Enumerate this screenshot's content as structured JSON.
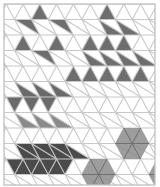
{
  "figure": {
    "width": 160,
    "height": 187,
    "grid": {
      "left": 4,
      "right": 155,
      "top": 4,
      "bottom": 185,
      "side": 16.8,
      "row_height": 15.5,
      "x0": 6.2,
      "line_color": "#c8c8c8",
      "border_color": "#c0c0c0",
      "rows": 12
    },
    "colors": {
      "medium": "#6e6e6e",
      "diamond": "#6a6a6a",
      "light": "#8a8a8a",
      "dark": "#4a4a4a",
      "hex": "#8c8c8c",
      "hex_lines": "#707070"
    },
    "shapes": [
      {
        "name": "single-triangle-top-left",
        "tone": "medium",
        "triangles": [
          {
            "row": 0,
            "k": 2,
            "dir": "up"
          }
        ]
      },
      {
        "name": "hourglass-left",
        "tone": "medium",
        "triangles": [
          {
            "row": 1,
            "k": 1,
            "dir": "down"
          },
          {
            "row": 1,
            "k": 3,
            "dir": "down"
          },
          {
            "row": 2,
            "k": 1,
            "dir": "up"
          },
          {
            "row": 2,
            "k": 3,
            "dir": "up"
          },
          {
            "row": 3,
            "k": 2,
            "dir": "down"
          }
        ]
      },
      {
        "name": "pyramid",
        "tone": "medium",
        "triangles": [
          {
            "row": 0,
            "k": 6,
            "dir": "up"
          },
          {
            "row": 1,
            "k": 6,
            "dir": "up"
          },
          {
            "row": 1,
            "k": 7,
            "dir": "up"
          },
          {
            "row": 2,
            "k": 5,
            "dir": "up"
          },
          {
            "row": 2,
            "k": 6,
            "dir": "up"
          },
          {
            "row": 2,
            "k": 7,
            "dir": "up"
          },
          {
            "row": 3,
            "k": 5,
            "dir": "up"
          },
          {
            "row": 3,
            "k": 6,
            "dir": "up"
          },
          {
            "row": 3,
            "k": 7,
            "dir": "up"
          },
          {
            "row": 3,
            "k": 8,
            "dir": "up"
          },
          {
            "row": 4,
            "k": 4,
            "dir": "up"
          },
          {
            "row": 4,
            "k": 5,
            "dir": "up"
          },
          {
            "row": 4,
            "k": 6,
            "dir": "up"
          },
          {
            "row": 4,
            "k": 7,
            "dir": "up"
          },
          {
            "row": 4,
            "k": 8,
            "dir": "up"
          }
        ]
      },
      {
        "name": "diamonds-left",
        "tone": "diamond",
        "triangles": [
          {
            "row": 5,
            "k": 1,
            "dir": "up"
          },
          {
            "row": 5,
            "k": 2,
            "dir": "up"
          },
          {
            "row": 5,
            "k": 3,
            "dir": "up"
          },
          {
            "row": 6,
            "k": 0,
            "dir": "down"
          },
          {
            "row": 6,
            "k": 1,
            "dir": "down"
          },
          {
            "row": 6,
            "k": 2,
            "dir": "down"
          }
        ]
      },
      {
        "name": "small-triangles-below-diamonds",
        "tone": "light",
        "triangles": [
          {
            "row": 7,
            "k": 1,
            "dir": "up"
          },
          {
            "row": 7,
            "k": 2,
            "dir": "up"
          },
          {
            "row": 7,
            "k": 3,
            "dir": "up"
          }
        ]
      },
      {
        "name": "dark-zigzag-band",
        "tone": "dark",
        "triangles": [
          {
            "row": 9,
            "k": 1,
            "dir": "up"
          },
          {
            "row": 9,
            "k": 2,
            "dir": "up"
          },
          {
            "row": 9,
            "k": 3,
            "dir": "up"
          },
          {
            "row": 9,
            "k": 4,
            "dir": "up"
          },
          {
            "row": 9,
            "k": 1,
            "dir": "down"
          },
          {
            "row": 9,
            "k": 2,
            "dir": "down"
          },
          {
            "row": 9,
            "k": 3,
            "dir": "down"
          },
          {
            "row": 10,
            "k": 0,
            "dir": "down"
          },
          {
            "row": 10,
            "k": 1,
            "dir": "down"
          },
          {
            "row": 10,
            "k": 2,
            "dir": "down"
          },
          {
            "row": 10,
            "k": 3,
            "dir": "down"
          },
          {
            "row": 10,
            "k": 1,
            "dir": "up"
          },
          {
            "row": 10,
            "k": 2,
            "dir": "up"
          },
          {
            "row": 10,
            "k": 3,
            "dir": "up"
          }
        ]
      }
    ],
    "hexagons": [
      {
        "name": "hexagon-right",
        "line": 9,
        "k": 8
      },
      {
        "name": "hexagon-bottom",
        "line": 11,
        "k": 6
      },
      {
        "name": "hexagon-partial-edge",
        "line": 11,
        "k": 10
      }
    ]
  }
}
